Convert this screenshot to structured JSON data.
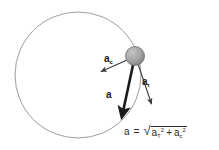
{
  "figure": {
    "type": "physics-vector-diagram",
    "background_color": "#ffffff",
    "stroke_color": "#3c3c3c",
    "circle": {
      "name": "circular-path",
      "center_x": 78,
      "center_y": 75,
      "radius": 63,
      "stroke": "#909090",
      "stroke_width": 0.9,
      "fill": "none"
    },
    "ball": {
      "name": "particle-ball",
      "center_x": 135,
      "center_y": 56,
      "radius": 9.5,
      "fill_light": "#b9b9b9",
      "fill_dark": "#8a8a8a",
      "edge_color": "#6f6f6f"
    },
    "vectors": [
      {
        "id": "ac",
        "label_base": "a",
        "label_sub": "c",
        "description": "centripetal-acceleration",
        "x1": 135,
        "y1": 56,
        "x2": 100,
        "y2": 72,
        "stroke": "#3c3c3c",
        "stroke_width": 1.1,
        "bold": false
      },
      {
        "id": "at",
        "label_base": "a",
        "label_sub": "t",
        "description": "tangential-acceleration",
        "x1": 135,
        "y1": 56,
        "x2": 152,
        "y2": 106,
        "stroke": "#3c3c3c",
        "stroke_width": 1.1,
        "bold": false
      },
      {
        "id": "a",
        "label_base": "a",
        "label_sub": "",
        "description": "resultant-acceleration",
        "x1": 135,
        "y1": 56,
        "x2": 122,
        "y2": 118,
        "stroke": "#1a1a1a",
        "stroke_width": 2.6,
        "bold": true
      }
    ],
    "equation": {
      "lhs": "a",
      "equals": "=",
      "radical": "√",
      "term1_base": "a",
      "term1_sub": "T",
      "term1_sup": "2",
      "operator": "+",
      "term2_base": "a",
      "term2_sub": "c",
      "term2_sup": "2",
      "plain_text": "a = √(a_T² + a_c²)"
    }
  }
}
